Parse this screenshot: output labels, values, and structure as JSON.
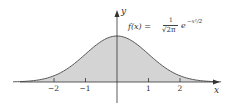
{
  "chart_data": {
    "type": "area",
    "title": "",
    "formula": {
      "lhs": "f(x) =",
      "numerator": "1",
      "denominator": "√2π",
      "exp": "e",
      "exponent": "−x²/2"
    },
    "xlabel": "x",
    "ylabel": "y",
    "x_ticks": [
      "−2",
      "−1",
      "1",
      "2"
    ],
    "x_tick_values": [
      -2,
      -1,
      1,
      2
    ],
    "xlim": [
      -3.6,
      3.5
    ],
    "ylim": [
      -0.1,
      0.55
    ],
    "grid": false,
    "legend": null,
    "series": [
      {
        "name": "standard normal density",
        "function": "f(x) = (1/sqrt(2*pi)) * exp(-x^2/2)",
        "x": [
          -3,
          -2.5,
          -2,
          -1.5,
          -1,
          -0.5,
          0,
          0.5,
          1,
          1.5,
          2,
          2.5,
          3
        ],
        "values": [
          0.0044,
          0.0175,
          0.054,
          0.1295,
          0.242,
          0.3521,
          0.3989,
          0.3521,
          0.242,
          0.1295,
          0.054,
          0.0175,
          0.0044
        ],
        "fill": true
      }
    ],
    "colors": {
      "fill": "#d4d4d4",
      "curve": "#555555",
      "axis": "#333333"
    }
  }
}
